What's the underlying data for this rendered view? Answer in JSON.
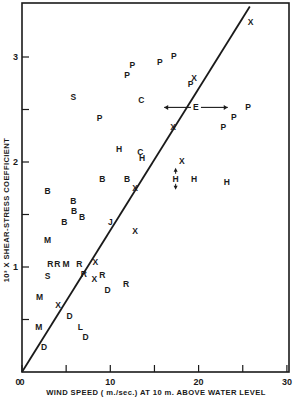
{
  "chart_data": {
    "type": "scatter",
    "title": "",
    "xlabel": "WIND SPEED (m./sec.) AT 10 m. ABOVE WATER LEVEL",
    "ylabel": "10³ X SHEAR-STRESS COEFFICIENT",
    "xlim": [
      0,
      30
    ],
    "ylim": [
      0,
      3.5
    ],
    "x_ticks": [
      0,
      5,
      10,
      15,
      20,
      25,
      30
    ],
    "x_tick_labels": [
      "0",
      "",
      "10",
      "",
      "20",
      "",
      "30"
    ],
    "y_ticks": [
      0,
      0.5,
      1,
      1.5,
      2,
      2.5,
      3
    ],
    "y_tick_labels": [
      "0",
      "",
      "1",
      "",
      "2",
      "",
      "3"
    ],
    "grid": false,
    "legend": "none (points labeled by source letter)",
    "fit_line": {
      "x": [
        0,
        25.8
      ],
      "y": [
        0,
        3.48
      ],
      "slope": 0.134
    },
    "series": [
      {
        "name": "S",
        "points": [
          [
            5.8,
            2.62
          ],
          [
            2.9,
            0.91
          ]
        ]
      },
      {
        "name": "P",
        "points": [
          [
            8.8,
            2.42
          ],
          [
            11.9,
            2.83
          ],
          [
            12.5,
            2.92
          ],
          [
            15.6,
            2.95
          ],
          [
            17.2,
            3.01
          ],
          [
            19.1,
            2.74
          ],
          [
            22.8,
            2.33
          ],
          [
            24.0,
            2.43
          ],
          [
            25.6,
            2.52
          ]
        ]
      },
      {
        "name": "C",
        "points": [
          [
            13.5,
            2.59
          ],
          [
            13.4,
            2.1
          ]
        ]
      },
      {
        "name": "X",
        "points": [
          [
            19.5,
            2.8
          ],
          [
            25.9,
            3.33
          ],
          [
            17.1,
            2.33
          ],
          [
            18.1,
            2.01
          ],
          [
            12.8,
            1.75
          ],
          [
            12.8,
            1.34
          ],
          [
            8.3,
            1.05
          ],
          [
            8.2,
            0.89
          ],
          [
            4.1,
            0.64
          ]
        ]
      },
      {
        "name": "E",
        "points": [
          [
            19.7,
            2.52
          ]
        ],
        "x_error": 3.6
      },
      {
        "name": "H",
        "points": [
          [
            11.0,
            2.12
          ],
          [
            13.6,
            2.04
          ],
          [
            17.4,
            1.84
          ],
          [
            19.5,
            1.84
          ],
          [
            23.2,
            1.81
          ]
        ],
        "y_error_on_index": 2
      },
      {
        "name": "B",
        "points": [
          [
            2.9,
            1.72
          ],
          [
            5.8,
            1.63
          ],
          [
            9.1,
            1.84
          ],
          [
            11.9,
            1.84
          ],
          [
            5.9,
            1.53
          ],
          [
            6.8,
            1.48
          ],
          [
            4.8,
            1.43
          ]
        ]
      },
      {
        "name": "J",
        "points": [
          [
            10.0,
            1.43
          ]
        ]
      },
      {
        "name": "M",
        "points": [
          [
            2.9,
            1.26
          ],
          [
            5.0,
            1.03
          ],
          [
            2.0,
            0.71
          ],
          [
            1.9,
            0.43
          ]
        ]
      },
      {
        "name": "R",
        "points": [
          [
            3.2,
            1.03
          ],
          [
            4.0,
            1.03
          ],
          [
            6.5,
            1.03
          ],
          [
            7.0,
            0.93
          ],
          [
            9.1,
            0.92
          ],
          [
            11.8,
            0.84
          ]
        ]
      },
      {
        "name": "D",
        "points": [
          [
            9.7,
            0.78
          ],
          [
            5.4,
            0.53
          ],
          [
            7.2,
            0.33
          ],
          [
            2.5,
            0.24
          ]
        ]
      },
      {
        "name": "L",
        "points": [
          [
            6.6,
            0.43
          ]
        ]
      }
    ]
  },
  "plot": {
    "x_axis_label": "WIND SPEED ( m./sec.) AT 10 m. ABOVE WATER LEVEL",
    "y_axis_label": "10³ X SHEAR-STRESS COEFFICIENT",
    "origin_label": "0"
  }
}
